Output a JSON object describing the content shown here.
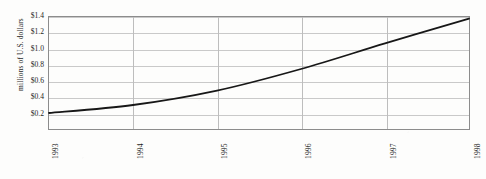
{
  "chart_data": {
    "type": "line",
    "title": "",
    "subtitle": "",
    "xlabel": "",
    "ylabel": "millions of U.S. dollars",
    "categories": [
      "1993",
      "1994",
      "1995",
      "1996",
      "1997",
      "1998"
    ],
    "x": [
      1993,
      1994,
      1995,
      1996,
      1997,
      1998
    ],
    "values": [
      0.2,
      0.3,
      0.48,
      0.75,
      1.07,
      1.38
    ],
    "series": [
      {
        "name": "",
        "values": [
          0.2,
          0.3,
          0.48,
          0.75,
          1.07,
          1.38
        ]
      }
    ],
    "ylim": [
      0.0,
      1.4
    ],
    "xlim": [
      1993,
      1998
    ],
    "y_ticks": [
      0.2,
      0.4,
      0.6,
      0.8,
      1.0,
      1.2,
      1.4
    ],
    "y_tick_labels": [
      "$0.2",
      "$0.4",
      "$0.6",
      "$0.8",
      "$1.0",
      "$1.2",
      "$1.4"
    ],
    "x_tick_labels": [
      "1993",
      "1994",
      "1995",
      "1996",
      "1997",
      "1998"
    ],
    "grid": "horizontal-and-vertical",
    "legend": "none",
    "line_color": "#171717",
    "grid_color": "#c9c9c9",
    "axis_color": "#8c8c8c",
    "background_color": "#fdfdfc",
    "annotations": []
  }
}
